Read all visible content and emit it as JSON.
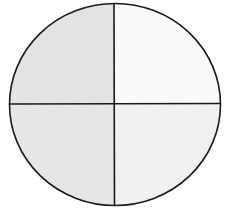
{
  "diagram": {
    "shape": "circle-divided-into-quarters",
    "quadrants": [
      {
        "position": "top-left",
        "fill": "#e3e3e3"
      },
      {
        "position": "top-right",
        "fill": "#fafafa"
      },
      {
        "position": "bottom-left",
        "fill": "#e6e6e6"
      },
      {
        "position": "bottom-right",
        "fill": "#f1f1f1"
      }
    ],
    "stroke": "#1a1a1a"
  }
}
